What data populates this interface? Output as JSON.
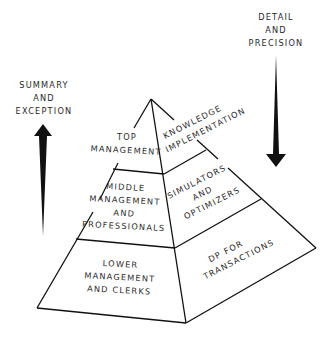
{
  "labels": {
    "left_arrow": [
      "SUMMARY",
      "AND",
      "EXCEPTION"
    ],
    "right_arrow": [
      "DETAIL",
      "AND",
      "PRECISION"
    ]
  },
  "pyramid": {
    "left_face": [
      {
        "tier": "top",
        "lines": [
          "TOP",
          "MANAGEMENT"
        ]
      },
      {
        "tier": "middle",
        "lines": [
          "MIDDLE",
          "MANAGEMENT",
          "AND",
          "PROFESSIONALS"
        ]
      },
      {
        "tier": "lower",
        "lines": [
          "LOWER",
          "MANAGEMENT",
          "AND CLERKS"
        ]
      }
    ],
    "right_face": [
      {
        "tier": "top",
        "lines": [
          "KNOWLEDGE",
          "IMPLEMENTATION"
        ]
      },
      {
        "tier": "middle",
        "lines": [
          "SIMULATORS",
          "AND",
          "OPTIMIZERS"
        ]
      },
      {
        "tier": "lower",
        "lines": [
          "DP FOR",
          "TRANSACTIONS"
        ]
      }
    ]
  },
  "colors": {
    "ink": "#111111",
    "paper": "#ffffff"
  }
}
